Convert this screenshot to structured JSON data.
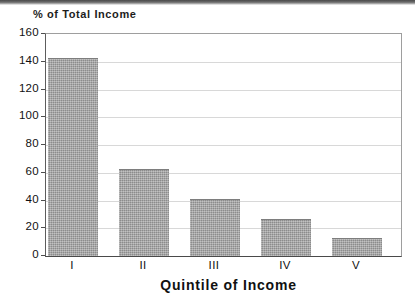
{
  "chart_data": {
    "type": "bar",
    "title": "",
    "xlabel": "Quintile of Income",
    "ylabel": "% of Total Income",
    "categories": [
      "I",
      "II",
      "III",
      "IV",
      "V"
    ],
    "values": [
      143,
      63,
      41,
      27,
      13
    ],
    "ylim": [
      0,
      160
    ],
    "yticks": [
      0,
      20,
      40,
      60,
      80,
      100,
      120,
      140,
      160
    ],
    "ytick_labels": [
      "0",
      "20",
      "40",
      "60",
      "80",
      "100",
      "120",
      "140",
      "160"
    ],
    "grid": true,
    "legend": null,
    "series": [
      {
        "name": "% of Total Income",
        "values": [
          143,
          63,
          41,
          27,
          13
        ],
        "color": "#9b9b9b"
      }
    ],
    "colors": {
      "bar_fill": "#9b9b9b",
      "bar_edge": "#7e7e7e",
      "gridline": "#d8d8d8",
      "axis": "#4a4a4a",
      "text": "#111111"
    }
  }
}
